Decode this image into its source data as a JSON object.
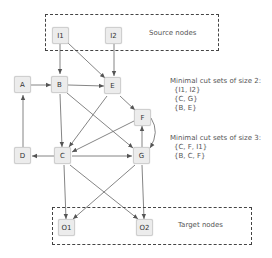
{
  "groups": {
    "source": {
      "label": "Source nodes"
    },
    "target": {
      "label": "Target nodes"
    }
  },
  "nodes": {
    "I1": "I1",
    "I2": "I2",
    "A": "A",
    "B": "B",
    "E": "E",
    "F": "F",
    "D": "D",
    "C": "C",
    "G": "G",
    "O1": "O1",
    "O2": "O2"
  },
  "edges": [
    [
      "I1",
      "B"
    ],
    [
      "I1",
      "E"
    ],
    [
      "I2",
      "E"
    ],
    [
      "A",
      "B"
    ],
    [
      "B",
      "E"
    ],
    [
      "B",
      "C"
    ],
    [
      "B",
      "G"
    ],
    [
      "E",
      "F"
    ],
    [
      "E",
      "C"
    ],
    [
      "F",
      "C"
    ],
    [
      "F",
      "G"
    ],
    [
      "G",
      "F"
    ],
    [
      "D",
      "A"
    ],
    [
      "C",
      "D"
    ],
    [
      "C",
      "G"
    ],
    [
      "C",
      "O1"
    ],
    [
      "C",
      "O2"
    ],
    [
      "G",
      "O1"
    ],
    [
      "G",
      "O2"
    ]
  ],
  "cut_sets_2": {
    "title": "Minimal cut sets of size 2:",
    "items": [
      "{I1, I2}",
      "{C, G}",
      "{B, E}"
    ]
  },
  "cut_sets_3": {
    "title": "Minimal cut sets of size 3:",
    "items": [
      "{C, F, I1}",
      "{B, C, F}"
    ]
  }
}
